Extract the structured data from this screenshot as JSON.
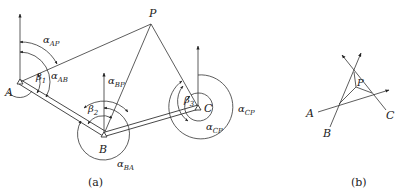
{
  "figure_a": {
    "caption": "(a)",
    "points": {
      "A": {
        "label": "A"
      },
      "B": {
        "label": "B"
      },
      "C": {
        "label": "C"
      },
      "P": {
        "label": "P"
      }
    },
    "angles": {
      "alpha_AP": {
        "base": "α",
        "sub": "AP"
      },
      "alpha_AB": {
        "base": "α",
        "sub": "AB"
      },
      "beta_1": {
        "base": "β",
        "sub": "1"
      },
      "alpha_BP": {
        "base": "α",
        "sub": "BP"
      },
      "beta_2": {
        "base": "β",
        "sub": "2"
      },
      "alpha_BA": {
        "base": "α",
        "sub": "BA"
      },
      "beta_3": {
        "base": "β",
        "sub": "3"
      },
      "alpha_CP_outer": {
        "base": "α",
        "sub": "CP"
      },
      "alpha_CP_inner": {
        "base": "α",
        "sub": "CP"
      }
    }
  },
  "figure_b": {
    "caption": "(b)",
    "points": {
      "A": {
        "label": "A"
      },
      "B": {
        "label": "B"
      },
      "C": {
        "label": "C"
      },
      "P": {
        "label": "P"
      }
    }
  },
  "colors": {
    "line": "#333333",
    "background": "#ffffff"
  }
}
